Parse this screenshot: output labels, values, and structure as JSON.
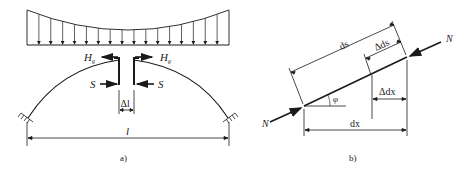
{
  "figure_a": {
    "caption": "a)",
    "labels": {
      "H_left": "H",
      "H_left_sub": "g",
      "H_right": "H",
      "H_right_sub": "g",
      "S_left": "S",
      "S_right": "S",
      "gap": "Δl",
      "span": "l"
    },
    "load_arrow_count": 17
  },
  "figure_b": {
    "caption": "b)",
    "labels": {
      "N_left": "N",
      "N_right": "N",
      "ds": "ds",
      "delta_ds": "Δds",
      "delta_dx": "Δdx",
      "dx": "dx",
      "angle": "φ"
    }
  },
  "colors": {
    "line": "#1a1a1a",
    "background": "#ffffff"
  }
}
